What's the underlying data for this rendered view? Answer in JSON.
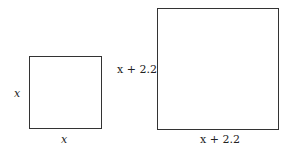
{
  "diagram": {
    "small_square": {
      "side_label_left": "x",
      "side_label_bottom": "x"
    },
    "large_square": {
      "side_label_left": "x + 2.2",
      "side_label_bottom": "x + 2.2"
    }
  }
}
